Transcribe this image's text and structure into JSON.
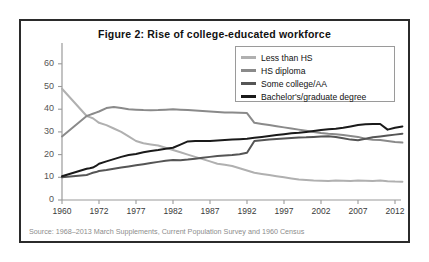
{
  "figure": {
    "title": "Figure 2: Rise of college-educated workforce",
    "source": "Source: 1968–2013 March Supplements, Current Population Survey and 1960 Census"
  },
  "legend": {
    "items": [
      {
        "label": "Less than HS",
        "color": "#b0b0b0",
        "swatch_name": "legend-swatch-less-than-hs"
      },
      {
        "label": "HS diploma",
        "color": "#8a8a8a",
        "swatch_name": "legend-swatch-hs-diploma"
      },
      {
        "label": "Some college/AA",
        "color": "#555555",
        "swatch_name": "legend-swatch-some-college"
      },
      {
        "label": "Bachelor's/graduate degree",
        "color": "#1a1a1a",
        "swatch_name": "legend-swatch-bachelors"
      }
    ]
  },
  "axes": {
    "y_ticks": [
      "60",
      "50",
      "40",
      "30",
      "20",
      "10",
      "0"
    ],
    "x_ticks": [
      "1960",
      "1972",
      "1977",
      "1982",
      "1987",
      "1992",
      "1997",
      "2002",
      "2007",
      "2012"
    ]
  },
  "chart_data": {
    "type": "line",
    "title": "Figure 2: Rise of college-educated workforce",
    "xlabel": "",
    "ylabel": "",
    "ylim": [
      0,
      63
    ],
    "grid": false,
    "legend_position": "top-right",
    "note": "Percent of workforce by highest educational attainment. X tick labels are evenly spaced although 1960→1972 spans 12 years.",
    "x_tick_labels": [
      "1960",
      "1972",
      "1977",
      "1982",
      "1987",
      "1992",
      "1997",
      "2002",
      "2007",
      "2012"
    ],
    "x": [
      1960,
      1968,
      1969,
      1970,
      1971,
      1972,
      1973,
      1974,
      1975,
      1976,
      1977,
      1978,
      1979,
      1980,
      1981,
      1982,
      1983,
      1984,
      1985,
      1986,
      1987,
      1988,
      1989,
      1990,
      1991,
      1992,
      1993,
      1994,
      1995,
      1996,
      1997,
      1998,
      1999,
      2000,
      2001,
      2002,
      2003,
      2004,
      2005,
      2006,
      2007,
      2008,
      2009,
      2010,
      2011,
      2012,
      2013
    ],
    "series": [
      {
        "name": "Less than HS",
        "color": "#b0b0b0",
        "values": [
          49,
          37,
          36.5,
          36,
          35,
          34,
          33,
          31.5,
          30,
          28,
          26,
          25,
          24.5,
          24,
          23,
          22,
          21,
          20,
          19,
          18,
          17,
          16,
          15.5,
          15,
          14,
          13,
          12,
          11.5,
          11,
          10.5,
          10,
          9.5,
          9,
          8.8,
          8.6,
          8.5,
          8.4,
          8.6,
          8.5,
          8.4,
          8.6,
          8.5,
          8.4,
          8.6,
          8.3,
          8.1,
          8
        ]
      },
      {
        "name": "HS diploma",
        "color": "#8a8a8a",
        "values": [
          28,
          37,
          37.5,
          38,
          38.5,
          39,
          40.5,
          41,
          40.5,
          40,
          39.8,
          39.6,
          39.5,
          39.6,
          39.8,
          40,
          39.8,
          39.6,
          39.4,
          39.2,
          39,
          38.8,
          38.6,
          38.5,
          38.4,
          38.3,
          34,
          33.5,
          33,
          32.5,
          32,
          31.5,
          31,
          30.5,
          30,
          29.5,
          29.2,
          29,
          28.6,
          28.2,
          27.8,
          27,
          26.5,
          26.4,
          26,
          25.6,
          25.3
        ]
      },
      {
        "name": "Some college/AA",
        "color": "#555555",
        "values": [
          10,
          11,
          11.5,
          12,
          12.3,
          12.8,
          13.2,
          13.8,
          14.3,
          14.8,
          15.3,
          15.8,
          16.3,
          16.8,
          17.3,
          17.6,
          17.5,
          17.8,
          18.2,
          18.6,
          19,
          19.4,
          19.6,
          19.8,
          20.2,
          20.8,
          26,
          26.3,
          26.6,
          26.9,
          27.1,
          27.3,
          27.5,
          27.6,
          27.8,
          28,
          28.1,
          27.8,
          27.2,
          26.6,
          26.3,
          27,
          27.6,
          28,
          28.4,
          28.8,
          29.2
        ]
      },
      {
        "name": "Bachelor's/graduate degree",
        "color": "#1a1a1a",
        "values": [
          10.5,
          13.8,
          14,
          14.3,
          15,
          16,
          17,
          18,
          19,
          19.8,
          20.3,
          21,
          21.6,
          22,
          22.6,
          23,
          24.4,
          25.8,
          26,
          26,
          26,
          26.2,
          26.4,
          26.6,
          26.8,
          27,
          27.4,
          27.8,
          28.2,
          28.6,
          29,
          29.4,
          29.6,
          30,
          30.4,
          30.8,
          31.2,
          31.4,
          31.8,
          32.4,
          33,
          33.4,
          33.5,
          33.5,
          31,
          31.8,
          32.4
        ]
      }
    ]
  }
}
